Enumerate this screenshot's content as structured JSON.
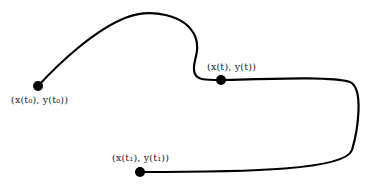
{
  "diagram": {
    "type": "parametric-curve",
    "stroke_color": "#000000",
    "points": {
      "start": {
        "label": "(x(t₀), y(t₀))",
        "x": 38,
        "y": 86
      },
      "middle": {
        "label": "(x(t), y(t))",
        "x": 221,
        "y": 80
      },
      "end": {
        "label": "(x(t₁), y(t₁))",
        "x": 140,
        "y": 172
      }
    }
  }
}
